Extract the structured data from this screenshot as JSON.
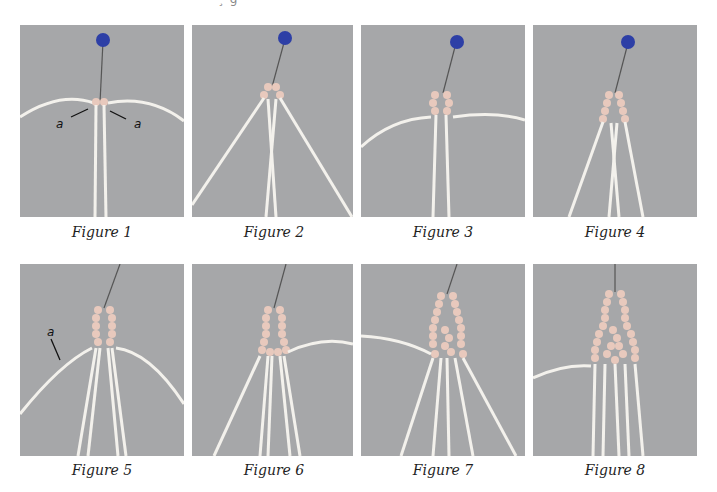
{
  "page": {
    "top_fragment": "¸ g",
    "background": "#ffffff",
    "panel_bg": "#a6a7a9",
    "pin_color": "#2d3fa6",
    "cord_color": "#f3f1ec",
    "knot_color": "#e8c9bd"
  },
  "figures": [
    {
      "caption": "Figure 1",
      "labels": [
        "a",
        "a"
      ]
    },
    {
      "caption": "Figure 2",
      "labels": []
    },
    {
      "caption": "Figure 3",
      "labels": []
    },
    {
      "caption": "Figure 4",
      "labels": []
    },
    {
      "caption": "Figure 5",
      "labels": [
        "a"
      ]
    },
    {
      "caption": "Figure 6",
      "labels": []
    },
    {
      "caption": "Figure 7",
      "labels": []
    },
    {
      "caption": "Figure 8",
      "labels": []
    }
  ]
}
